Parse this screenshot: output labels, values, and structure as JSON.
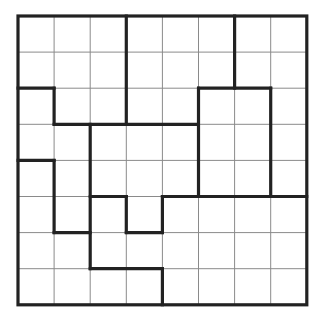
{
  "puzzle": {
    "type": "jigsaw-grid",
    "rows": 8,
    "cols": 8,
    "origin": [
      18,
      16
    ],
    "cell_size": 36.1,
    "colors": {
      "background": "#ffffff",
      "thin_line": "#8a8a8a",
      "thick_line": "#222222"
    },
    "cells": [
      [
        "",
        "",
        "",
        "",
        "",
        "",
        "",
        ""
      ],
      [
        "",
        "",
        "",
        "",
        "",
        "",
        "",
        ""
      ],
      [
        "",
        "",
        "",
        "",
        "",
        "",
        "",
        ""
      ],
      [
        "",
        "",
        "",
        "",
        "",
        "",
        "",
        ""
      ],
      [
        "",
        "",
        "",
        "",
        "",
        "",
        "",
        ""
      ],
      [
        "",
        "",
        "",
        "",
        "",
        "",
        "",
        ""
      ],
      [
        "",
        "",
        "",
        "",
        "",
        "",
        "",
        ""
      ],
      [
        "",
        "",
        "",
        "",
        "",
        "",
        "",
        ""
      ]
    ],
    "region_borders": [
      {
        "orient": "v",
        "at": 3,
        "from": 0,
        "to": 3
      },
      {
        "orient": "v",
        "at": 6,
        "from": 0,
        "to": 2
      },
      {
        "orient": "h",
        "at": 2,
        "from": 0,
        "to": 1
      },
      {
        "orient": "v",
        "at": 1,
        "from": 2,
        "to": 3
      },
      {
        "orient": "h",
        "at": 3,
        "from": 1,
        "to": 5
      },
      {
        "orient": "h",
        "at": 2,
        "from": 5,
        "to": 7
      },
      {
        "orient": "v",
        "at": 5,
        "from": 2,
        "to": 5
      },
      {
        "orient": "v",
        "at": 7,
        "from": 2,
        "to": 5
      },
      {
        "orient": "v",
        "at": 2,
        "from": 3,
        "to": 7
      },
      {
        "orient": "h",
        "at": 4,
        "from": 0,
        "to": 1
      },
      {
        "orient": "v",
        "at": 1,
        "from": 4,
        "to": 6
      },
      {
        "orient": "h",
        "at": 6,
        "from": 1,
        "to": 2
      },
      {
        "orient": "h",
        "at": 5,
        "from": 2,
        "to": 3
      },
      {
        "orient": "v",
        "at": 3,
        "from": 5,
        "to": 6
      },
      {
        "orient": "h",
        "at": 6,
        "from": 3,
        "to": 4
      },
      {
        "orient": "v",
        "at": 4,
        "from": 5,
        "to": 6
      },
      {
        "orient": "h",
        "at": 5,
        "from": 4,
        "to": 8
      },
      {
        "orient": "h",
        "at": 7,
        "from": 2,
        "to": 4
      },
      {
        "orient": "v",
        "at": 4,
        "from": 7,
        "to": 8
      }
    ]
  }
}
